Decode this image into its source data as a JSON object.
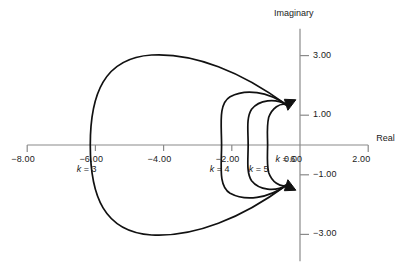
{
  "chart_data": {
    "type": "line",
    "title": "",
    "xlabel": "Real",
    "ylabel": "Imaginary",
    "xlim": [
      -8.6,
      2.6
    ],
    "ylim": [
      -4.0,
      4.0
    ],
    "grid": false,
    "legend_position": "inline-annotations",
    "x_ticks": [
      "-8.00",
      "-6.00",
      "-4.00",
      "-2.00",
      "0.00",
      "2.00"
    ],
    "x_tick_values": [
      -8,
      -6,
      -4,
      -2,
      0,
      2
    ],
    "y_ticks": [
      "3.00",
      "1.00",
      "-1.00",
      "-3.00"
    ],
    "y_tick_values": [
      3,
      1,
      -1,
      -3
    ],
    "annotations": [
      "k = 3",
      "k = 4",
      "k = 5",
      "k = 6"
    ],
    "convergence_point": [
      -0.4,
      1.35
    ],
    "series": [
      {
        "name": "k = 3",
        "label": "k = 3",
        "label_x": -6.55,
        "label_y": -0.85,
        "real_axis_crossing": -6.15,
        "max_imag": 3.05,
        "min_imag": -3.05,
        "path": "M -0.40 1.35 C -1.70 2.45 -3.10 3.10 -4.35 3.02 C -5.75 2.92 -6.15 1.70 -6.15 0.00 C -6.15 -1.70 -5.75 -2.92 -4.35 -3.02 C -3.10 -3.10 -1.70 -2.45 -0.40 -1.35"
      },
      {
        "name": "k = 4",
        "label": "k = 4",
        "label_x": -2.65,
        "label_y": -0.85,
        "real_axis_crossing": -2.3,
        "max_imag": 1.85,
        "min_imag": -1.85,
        "path": "M -0.40 1.35 C -0.95 1.80 -1.60 1.90 -2.05 1.62 C -2.40 1.38 -2.30 0.70 -2.30 0.00 C -2.30 -0.70 -2.40 -1.38 -2.05 -1.62 C -1.60 -1.90 -0.95 -1.80 -0.40 -1.35"
      },
      {
        "name": "k = 5",
        "label": "k = 5",
        "label_x": -1.5,
        "label_y": -0.85,
        "real_axis_crossing": -1.52,
        "max_imag": 1.52,
        "min_imag": -1.52,
        "path": "M -0.40 1.35 C -0.72 1.58 -1.20 1.52 -1.42 1.20 C -1.58 0.92 -1.52 0.48 -1.52 0.00 C -1.52 -0.48 -1.58 -0.92 -1.42 -1.20 C -1.20 -1.52 -0.72 -1.58 -0.40 -1.35"
      },
      {
        "name": "k = 6",
        "label": "k = 6",
        "label_x": -0.72,
        "label_y": -0.52,
        "real_axis_crossing": -0.95,
        "max_imag": 1.4,
        "min_imag": -1.4,
        "path": "M -0.40 1.35 C -0.58 1.42 -0.82 1.25 -0.92 0.92 C -0.98 0.62 -0.95 0.30 -0.95 0.00 C -0.95 -0.30 -0.98 -0.62 -0.92 -0.92 C -0.82 -1.25 -0.58 -1.42 -0.40 -1.35"
      }
    ],
    "colors": {
      "curve": "#111111",
      "axis": "#8a8a8a",
      "text": "#1a1a1a",
      "background": "#ffffff"
    },
    "arrowheads": [
      {
        "at": [
          -0.4,
          1.35
        ],
        "direction": "down"
      },
      {
        "at": [
          -0.4,
          -1.35
        ],
        "direction": "up"
      }
    ]
  }
}
